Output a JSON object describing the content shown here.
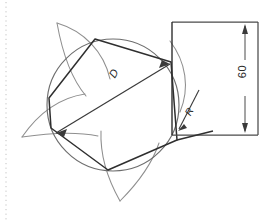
{
  "drawing": {
    "title": "hexagon-inscribed-in-circle-technical-drawing",
    "background_color": "#ffffff",
    "line_color": "#3a3a3a",
    "construction_line_color": "#8a8a8a",
    "dimension_line_color": "#4a4a4a",
    "margin_line_color": "#b9b9b9"
  },
  "dimensions": {
    "height_label": "60",
    "diameter_label": "D",
    "radius_label": "R"
  },
  "geometry": {
    "circle": {
      "cx": 113,
      "cy": 105,
      "r": 66
    },
    "hexagon_vertices": [
      {
        "x": 95,
        "y": 39
      },
      {
        "x": 171,
        "y": 62
      },
      {
        "x": 177,
        "y": 140
      },
      {
        "x": 108,
        "y": 170
      },
      {
        "x": 51,
        "y": 128
      },
      {
        "x": 49,
        "y": 98
      }
    ],
    "diameter_line": {
      "x1": 56,
      "y1": 133,
      "x2": 170,
      "y2": 64
    },
    "rectangle": {
      "x": 172,
      "y": 22,
      "width": 86,
      "height": 113
    },
    "dimension_axis_x": 245,
    "radius_leader": {
      "x1": 196,
      "y1": 94,
      "x2": 178,
      "y2": 128
    }
  }
}
